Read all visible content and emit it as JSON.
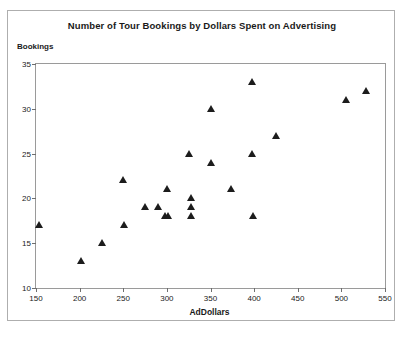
{
  "chart_data": {
    "type": "scatter",
    "title": "Number of Tour Bookings by Dollars Spent on Advertising",
    "xlabel": "AdDollars",
    "ylabel": "Bookings",
    "xlim": [
      150,
      550
    ],
    "ylim": [
      10,
      35
    ],
    "xticks": [
      150,
      200,
      250,
      300,
      350,
      400,
      450,
      500,
      550
    ],
    "yticks": [
      10,
      15,
      20,
      25,
      30,
      35
    ],
    "grid": false,
    "legend": false,
    "marker": "triangle",
    "marker_color": "#1c1c1c",
    "points": [
      {
        "x": 153,
        "y": 17
      },
      {
        "x": 202,
        "y": 13
      },
      {
        "x": 226,
        "y": 15
      },
      {
        "x": 250,
        "y": 22
      },
      {
        "x": 251,
        "y": 17
      },
      {
        "x": 275,
        "y": 19
      },
      {
        "x": 290,
        "y": 19
      },
      {
        "x": 298,
        "y": 18
      },
      {
        "x": 300,
        "y": 21
      },
      {
        "x": 301,
        "y": 18
      },
      {
        "x": 325,
        "y": 25
      },
      {
        "x": 328,
        "y": 20
      },
      {
        "x": 328,
        "y": 19
      },
      {
        "x": 328,
        "y": 18
      },
      {
        "x": 350,
        "y": 30
      },
      {
        "x": 350,
        "y": 24
      },
      {
        "x": 374,
        "y": 21
      },
      {
        "x": 398,
        "y": 33
      },
      {
        "x": 398,
        "y": 25
      },
      {
        "x": 399,
        "y": 18
      },
      {
        "x": 425,
        "y": 27
      },
      {
        "x": 505,
        "y": 31
      },
      {
        "x": 528,
        "y": 32
      }
    ]
  }
}
